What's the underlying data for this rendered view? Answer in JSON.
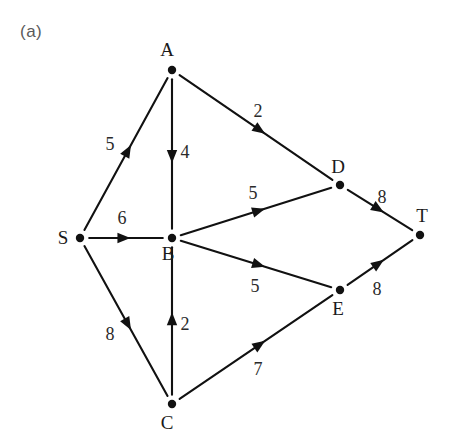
{
  "figure": {
    "panel_label": "(a)",
    "caption_label_color": "#5a5a5a",
    "background_color": "#ffffff",
    "stroke_color": "#111111",
    "width": 450,
    "height": 447
  },
  "chart_data": {
    "type": "diagram",
    "diagram_kind": "directed-weighted-graph",
    "title": "(a)",
    "directed": true,
    "weighted": true,
    "nodes": [
      {
        "id": "S",
        "label": "S",
        "x": 80,
        "y": 238,
        "label_dx": -17,
        "label_dy": 6
      },
      {
        "id": "A",
        "label": "A",
        "x": 172,
        "y": 70,
        "label_dx": -5,
        "label_dy": -14
      },
      {
        "id": "B",
        "label": "B",
        "x": 172,
        "y": 238,
        "label_dx": -4,
        "label_dy": 22
      },
      {
        "id": "C",
        "label": "C",
        "x": 172,
        "y": 404,
        "label_dx": -5,
        "label_dy": 25
      },
      {
        "id": "D",
        "label": "D",
        "x": 340,
        "y": 185,
        "label_dx": -2,
        "label_dy": -12
      },
      {
        "id": "E",
        "label": "E",
        "x": 340,
        "y": 290,
        "label_dx": -2,
        "label_dy": 25
      },
      {
        "id": "T",
        "label": "T",
        "x": 420,
        "y": 235,
        "label_dx": 2,
        "label_dy": -13
      }
    ],
    "edges": [
      {
        "from": "S",
        "to": "A",
        "weight": 5,
        "label": "5",
        "label_x": 110,
        "label_y": 150
      },
      {
        "from": "S",
        "to": "B",
        "weight": 6,
        "label": "6",
        "label_x": 122,
        "label_y": 224
      },
      {
        "from": "S",
        "to": "C",
        "weight": 8,
        "label": "8",
        "label_x": 110,
        "label_y": 340
      },
      {
        "from": "A",
        "to": "B",
        "weight": 4,
        "label": "4",
        "label_x": 185,
        "label_y": 158
      },
      {
        "from": "A",
        "to": "D",
        "weight": 2,
        "label": "2",
        "label_x": 258,
        "label_y": 117
      },
      {
        "from": "C",
        "to": "B",
        "weight": 2,
        "label": "2",
        "label_x": 185,
        "label_y": 330
      },
      {
        "from": "C",
        "to": "E",
        "weight": 7,
        "label": "7",
        "label_x": 258,
        "label_y": 375
      },
      {
        "from": "B",
        "to": "D",
        "weight": 5,
        "label": "5",
        "label_x": 253,
        "label_y": 199
      },
      {
        "from": "B",
        "to": "E",
        "weight": 5,
        "label": "5",
        "label_x": 255,
        "label_y": 292
      },
      {
        "from": "D",
        "to": "T",
        "weight": 8,
        "label": "8",
        "label_x": 382,
        "label_y": 203
      },
      {
        "from": "E",
        "to": "T",
        "weight": 8,
        "label": "8",
        "label_x": 377,
        "label_y": 295
      }
    ],
    "source_node": "S",
    "sink_node": "T"
  }
}
